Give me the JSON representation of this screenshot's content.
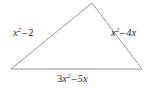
{
  "figure": {
    "name": "triangle-with-polynomial-side-labels",
    "shape": "triangle",
    "stroke_color": "#9a9a9a",
    "background_color": "#ffffff",
    "text_color": "#2b2b2b",
    "vertices": {
      "apex": {
        "x": 92,
        "y": 3
      },
      "bottom_left": {
        "x": 11,
        "y": 69
      },
      "bottom_right": {
        "x": 142,
        "y": 69
      }
    },
    "labels": {
      "left": {
        "text": "x^2 - 2",
        "base": "x",
        "exponent": "2",
        "operator": "–",
        "term": "2"
      },
      "right": {
        "text": "x^2 - 4x",
        "base": "x",
        "exponent": "2",
        "operator": "–",
        "term": "4x"
      },
      "bottom": {
        "text": "3x^2 - 5x",
        "coefficient": "3",
        "base": "x",
        "exponent": "2",
        "operator": "–",
        "term": "5x"
      }
    }
  }
}
